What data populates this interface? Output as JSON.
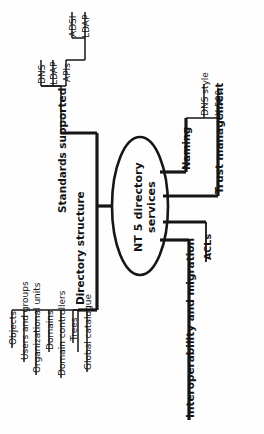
{
  "diagram": {
    "type": "mind-map",
    "orientation": "rotated-90-ccw",
    "center": {
      "label": "NT 5 directory services",
      "shape": "ellipse"
    },
    "branches": [
      {
        "label": "Standards supported",
        "bold": true,
        "children": [
          {
            "label": "DNS",
            "children": []
          },
          {
            "label": "LDAP",
            "children": []
          },
          {
            "label": "APIs",
            "children": [
              {
                "label": "ADSI"
              },
              {
                "label": "LDAP"
              }
            ]
          }
        ]
      },
      {
        "label": "Directory structure",
        "bold": true,
        "children": [
          {
            "label": "Objects"
          },
          {
            "label": "Users and groups"
          },
          {
            "label": "Organizational units"
          },
          {
            "label": "Domains"
          },
          {
            "label": "Domain controllers"
          },
          {
            "label": "Trees"
          },
          {
            "label": "Global catalogue"
          }
        ]
      },
      {
        "label": "Naming",
        "bold": true,
        "children": [
          {
            "label": "DNS style"
          },
          {
            "label": "X.500"
          }
        ]
      },
      {
        "label": "Trust management",
        "bold": true,
        "children": []
      },
      {
        "label": "Interoperability and migration",
        "bold": true,
        "children": [
          {
            "label": "ACLs"
          }
        ]
      }
    ],
    "colors": {
      "ink": "#161616",
      "background": "#ffffff"
    }
  },
  "labels": {
    "center": "NT 5 directory services",
    "standards_supported": "Standards supported",
    "dns": "DNS",
    "ldap_top": "LDAP",
    "apis": "APIs",
    "adsi": "ADSI",
    "ldap_sub": "LDAP",
    "directory_structure": "Directory structure",
    "objects": "Objects",
    "users_and_groups": "Users and groups",
    "organizational_units": "Organizational units",
    "domains": "Domains",
    "domain_controllers": "Domain controllers",
    "trees": "Trees",
    "global_catalogue": "Global catalogue",
    "naming": "Naming",
    "dns_style": "DNS style",
    "x500": "X.500",
    "trust_management": "Trust management",
    "interoperability_and_migration": "Interoperability and migration",
    "acls": "ACLs"
  }
}
